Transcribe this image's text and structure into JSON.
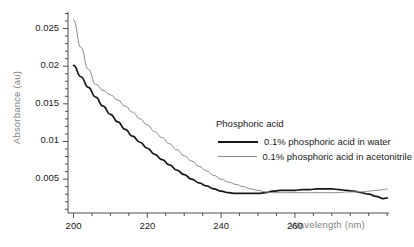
{
  "chart_data": {
    "type": "line",
    "title": "",
    "xlabel": "Wavelength (nm)",
    "ylabel": "Absorbance (au)",
    "xlim": [
      198.5,
      285.5
    ],
    "ylim": [
      0.0005,
      0.0272
    ],
    "grid": false,
    "legend_position": "inside-right",
    "legend_title": "Phosphoric acid",
    "xticks": [
      200,
      220,
      240,
      260
    ],
    "xtick_labels": [
      "200",
      "220",
      "240",
      "260"
    ],
    "xtick_minor_step": 5,
    "yticks": [
      0.005,
      0.01,
      0.015,
      0.02,
      0.025
    ],
    "ytick_labels": [
      "0.005",
      "0.01",
      "0.015",
      "0.02",
      "0.025"
    ],
    "ytick_minor_step": 0.001,
    "series": [
      {
        "name": "0.1% phosphoric acid in water",
        "color": "#161616",
        "width": 1.7,
        "x": [
          200,
          202,
          204,
          206,
          208,
          210,
          212,
          214,
          216,
          218,
          220,
          222,
          224,
          226,
          228,
          230,
          232,
          234,
          236,
          238,
          240,
          242,
          244,
          246,
          248,
          250,
          252,
          254,
          256,
          258,
          260,
          262,
          264,
          266,
          268,
          270,
          272,
          274,
          276,
          278,
          280,
          282,
          284,
          285
        ],
        "y": [
          0.0201,
          0.0186,
          0.0172,
          0.0159,
          0.0147,
          0.0136,
          0.0126,
          0.0116,
          0.0107,
          0.0099,
          0.0091,
          0.0083,
          0.0076,
          0.0069,
          0.0062,
          0.0056,
          0.005,
          0.0045,
          0.0041,
          0.0037,
          0.0034,
          0.0032,
          0.0031,
          0.0031,
          0.0031,
          0.0031,
          0.0032,
          0.0034,
          0.0035,
          0.0035,
          0.0035,
          0.0036,
          0.0036,
          0.0037,
          0.0037,
          0.0037,
          0.0036,
          0.0035,
          0.0034,
          0.0032,
          0.003,
          0.0027,
          0.0024,
          0.0025
        ]
      },
      {
        "name": "0.1% phosphoric acid in acetonitrile",
        "color": "#8a8a8a",
        "width": 1.0,
        "x": [
          200,
          202,
          204,
          206,
          208,
          210,
          212,
          214,
          216,
          218,
          220,
          222,
          224,
          226,
          228,
          230,
          232,
          234,
          236,
          238,
          240,
          242,
          244,
          246,
          248,
          250,
          252,
          254,
          256,
          258,
          260,
          262,
          264,
          266,
          268,
          270,
          272,
          274,
          276,
          278,
          280,
          282,
          284,
          285
        ],
        "y": [
          0.0262,
          0.0225,
          0.0196,
          0.0176,
          0.0168,
          0.0162,
          0.0155,
          0.0147,
          0.0139,
          0.013,
          0.0122,
          0.0113,
          0.0105,
          0.0097,
          0.0089,
          0.0081,
          0.0074,
          0.0067,
          0.0061,
          0.0055,
          0.005,
          0.0046,
          0.0043,
          0.004,
          0.0037,
          0.0035,
          0.0033,
          0.0032,
          0.0032,
          0.0032,
          0.0032,
          0.0032,
          0.0032,
          0.0032,
          0.0032,
          0.0032,
          0.0032,
          0.0033,
          0.0033,
          0.0033,
          0.0034,
          0.0035,
          0.0036,
          0.0037
        ]
      }
    ]
  },
  "legend": {
    "title": "Phosphoric acid",
    "entries": [
      {
        "label": "0.1% phosphoric acid in water",
        "swatch": "black-line"
      },
      {
        "label": "0.1% phosphoric acid in acetonitrile",
        "swatch": "gray-line"
      }
    ]
  },
  "axes": {
    "x_title": "Wavelength (nm)",
    "y_title": "Absorbance (au)",
    "x_labels": [
      "200",
      "220",
      "240",
      "260"
    ],
    "y_labels": [
      "0.005",
      "0.01",
      "0.015",
      "0.02",
      "0.025"
    ]
  },
  "colors": {
    "series_water": "#161616",
    "series_acetonitrile": "#8a8a8a",
    "axis": "#4d4d4d",
    "axis_title": "#808080",
    "tick_label": "#1a1a1a",
    "background": "#ffffff"
  }
}
